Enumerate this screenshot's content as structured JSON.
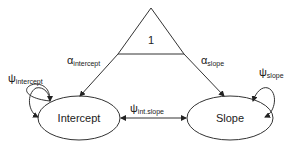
{
  "diagram": {
    "constant": {
      "label": "1"
    },
    "nodes": [
      {
        "id": "intercept",
        "label": "Intercept"
      },
      {
        "id": "slope",
        "label": "Slope"
      }
    ],
    "paths": {
      "alpha_intercept": {
        "symbol": "α",
        "sub": "intercept"
      },
      "alpha_slope": {
        "symbol": "α",
        "sub": "slope"
      },
      "psi_intercept": {
        "symbol": "ψ",
        "sub": "intercept"
      },
      "psi_slope": {
        "symbol": "ψ",
        "sub": "slope"
      },
      "psi_int_slope": {
        "symbol": "ψ",
        "sub": "int.slope"
      }
    }
  }
}
